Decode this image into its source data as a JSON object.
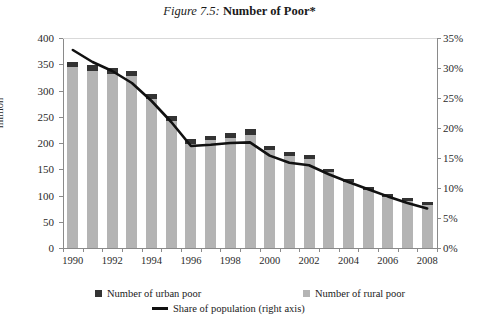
{
  "title": {
    "prefix": "Figure 7.5:",
    "main": "Number of Poor*"
  },
  "chart_data": {
    "type": "bar",
    "title": "Figure 7.5: Number of Poor*",
    "xlabel": "",
    "ylabel": "million",
    "y2label": "",
    "ylim": [
      0,
      400
    ],
    "y2lim": [
      0,
      35
    ],
    "yticks": [
      "0",
      "50",
      "100",
      "150",
      "200",
      "250",
      "300",
      "350",
      "400"
    ],
    "y2ticks": [
      "0%",
      "5%",
      "10%",
      "15%",
      "20%",
      "25%",
      "30%",
      "35%"
    ],
    "grid": false,
    "legend_position": "bottom",
    "categories": [
      1990,
      1991,
      1992,
      1993,
      1994,
      1995,
      1996,
      1997,
      1998,
      1999,
      2000,
      2001,
      2002,
      2003,
      2004,
      2005,
      2006,
      2007,
      2008
    ],
    "xtick_labels": [
      "1990",
      "",
      "1992",
      "",
      "1994",
      "",
      "1996",
      "",
      "1998",
      "",
      "2000",
      "",
      "2002",
      "",
      "2004",
      "",
      "2006",
      "",
      "2008"
    ],
    "stacked": true,
    "series": [
      {
        "name": "Number of rural poor",
        "color": "#b4b4b4",
        "axis": "left",
        "values": [
          345,
          338,
          332,
          327,
          284,
          242,
          199,
          205,
          210,
          216,
          186,
          175,
          170,
          144,
          125,
          110,
          97,
          90,
          82
        ]
      },
      {
        "name": "Number of urban poor",
        "color": "#333333",
        "axis": "left",
        "values": [
          10,
          10,
          10,
          10,
          10,
          9,
          9,
          9,
          10,
          10,
          8,
          8,
          8,
          7,
          7,
          6,
          6,
          6,
          6
        ]
      }
    ],
    "line_series": {
      "name": "Share of population (right axis)",
      "color": "#111111",
      "axis": "right",
      "unit": "%",
      "values": [
        33.0,
        31.0,
        29.5,
        27.5,
        24.5,
        21.0,
        17.0,
        17.2,
        17.5,
        17.6,
        15.4,
        14.2,
        13.8,
        12.3,
        11.0,
        9.8,
        8.6,
        7.5,
        6.6
      ]
    },
    "totals": [
      355,
      348,
      342,
      337,
      294,
      251,
      208,
      214,
      220,
      226,
      194,
      183,
      178,
      151,
      132,
      116,
      103,
      96,
      88
    ]
  },
  "legend": [
    {
      "label": "Number of urban poor",
      "marker": "square",
      "color": "#333333"
    },
    {
      "label": "Number of rural poor",
      "marker": "square",
      "color": "#b4b4b4"
    },
    {
      "label": "Share of population (right axis)",
      "marker": "line",
      "color": "#111111"
    }
  ]
}
